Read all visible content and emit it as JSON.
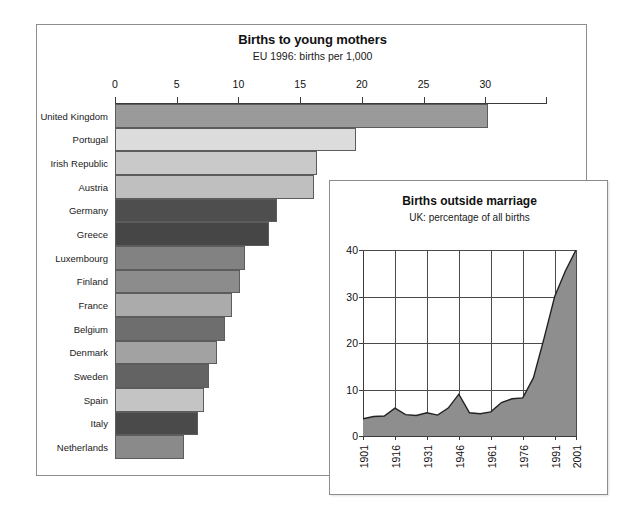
{
  "main_chart": {
    "title": "Births to young mothers",
    "subtitle": "EU 1996: births per 1,000"
  },
  "inset_chart": {
    "title": "Births outside marriage",
    "subtitle": "UK: percentage of all births"
  },
  "chart_data": [
    {
      "type": "bar",
      "orientation": "horizontal",
      "title": "Births to young mothers",
      "subtitle": "EU 1996: births per 1,000",
      "xlabel": "",
      "ylabel": "",
      "xlim": [
        0,
        35
      ],
      "xticks": [
        0,
        5,
        10,
        15,
        20,
        25,
        30
      ],
      "grid": false,
      "legend": "none",
      "categories": [
        "United Kingdom",
        "Portugal",
        "Irish Republic",
        "Austria",
        "Germany",
        "Greece",
        "Luxembourg",
        "Finland",
        "France",
        "Belgium",
        "Denmark",
        "Sweden",
        "Spain",
        "Italy",
        "Netherlands"
      ],
      "values": [
        30.2,
        19.5,
        16.4,
        16.1,
        13.1,
        12.5,
        10.5,
        10.1,
        9.5,
        8.9,
        8.3,
        7.6,
        7.2,
        6.7,
        5.6
      ],
      "bar_colors": [
        "#9a9a9a",
        "#dcdcdc",
        "#c9c9c9",
        "#bfbfbf",
        "#4e4e4e",
        "#464646",
        "#828282",
        "#8c8c8c",
        "#ababab",
        "#6e6e6e",
        "#a2a2a2",
        "#636363",
        "#c4c4c4",
        "#4a4a4a",
        "#8a8a8a"
      ]
    },
    {
      "type": "area",
      "title": "Births outside marriage",
      "subtitle": "UK: percentage of all births",
      "xlabel": "",
      "ylabel": "",
      "ylim": [
        0,
        40
      ],
      "yticks": [
        0,
        10,
        20,
        30,
        40
      ],
      "xlim": [
        1901,
        2001
      ],
      "xticks": [
        1901,
        1916,
        1931,
        1946,
        1961,
        1976,
        1991,
        2001
      ],
      "xtick_labels": [
        "1901",
        "1916",
        "1931",
        "1946",
        "1961",
        "1976",
        "1991",
        "2001"
      ],
      "grid": true,
      "legend": "none",
      "fill_color": "#8e8e8e",
      "line_color": "#222222",
      "x": [
        1901,
        1906,
        1911,
        1916,
        1921,
        1926,
        1931,
        1936,
        1941,
        1946,
        1951,
        1956,
        1961,
        1966,
        1971,
        1976,
        1981,
        1986,
        1991,
        1996,
        2001
      ],
      "values": [
        3.7,
        4.2,
        4.3,
        6.0,
        4.6,
        4.4,
        5.0,
        4.5,
        6.0,
        9.0,
        5.0,
        4.8,
        5.2,
        7.2,
        8.0,
        8.2,
        12.5,
        21.0,
        30.0,
        35.5,
        40.0
      ]
    }
  ]
}
